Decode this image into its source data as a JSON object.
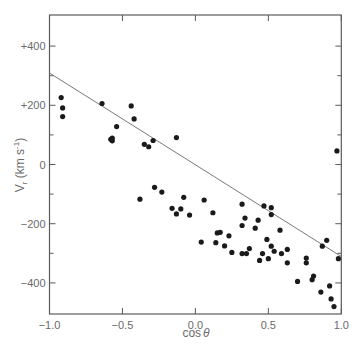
{
  "chart_data": {
    "type": "scatter",
    "title": "",
    "xlabel": "cos θ",
    "ylabel": "V_r (km s^-1)",
    "xlim": [
      -1.0,
      1.0
    ],
    "ylim": [
      -505,
      505
    ],
    "x_ticks": [
      -1.0,
      -0.5,
      0.0,
      0.5,
      1.0
    ],
    "x_tick_labels": [
      "−1.0",
      "−0.5",
      "0.0",
      "0.5",
      "1.0"
    ],
    "y_ticks": [
      400,
      200,
      0,
      -200,
      -400
    ],
    "y_tick_labels": [
      "+400",
      "+200",
      "0",
      "−200",
      "−400"
    ],
    "y_minor_ticks": [
      300,
      100,
      -100,
      -300
    ],
    "grid": false,
    "legend": null,
    "fit_line": {
      "x": [
        -1.0,
        1.0
      ],
      "y": [
        309,
        -311
      ]
    },
    "series": [
      {
        "name": "data",
        "points": [
          [
            -0.92,
            226
          ],
          [
            -0.91,
            191
          ],
          [
            -0.91,
            162
          ],
          [
            -0.64,
            206
          ],
          [
            -0.44,
            198
          ],
          [
            -0.42,
            154
          ],
          [
            -0.54,
            128
          ],
          [
            -0.58,
            85
          ],
          [
            -0.57,
            89
          ],
          [
            -0.57,
            80
          ],
          [
            -0.35,
            68
          ],
          [
            -0.32,
            60
          ],
          [
            -0.29,
            81
          ],
          [
            -0.13,
            91
          ],
          [
            -0.38,
            -117
          ],
          [
            -0.28,
            -77
          ],
          [
            -0.23,
            -93
          ],
          [
            -0.16,
            -148
          ],
          [
            -0.1,
            -150
          ],
          [
            -0.13,
            -167
          ],
          [
            -0.08,
            -111
          ],
          [
            -0.04,
            -171
          ],
          [
            0.06,
            -120
          ],
          [
            0.12,
            -163
          ],
          [
            0.15,
            -231
          ],
          [
            0.17,
            -229
          ],
          [
            0.04,
            -262
          ],
          [
            0.14,
            -264
          ],
          [
            0.2,
            -275
          ],
          [
            0.23,
            -241
          ],
          [
            0.25,
            -297
          ],
          [
            0.32,
            -134
          ],
          [
            0.34,
            -181
          ],
          [
            0.32,
            -206
          ],
          [
            0.41,
            -215
          ],
          [
            0.43,
            -188
          ],
          [
            0.47,
            -140
          ],
          [
            0.52,
            -146
          ],
          [
            0.52,
            -169
          ],
          [
            0.32,
            -301
          ],
          [
            0.35,
            -301
          ],
          [
            0.37,
            -284
          ],
          [
            0.44,
            -324
          ],
          [
            0.46,
            -301
          ],
          [
            0.49,
            -253
          ],
          [
            0.5,
            -318
          ],
          [
            0.52,
            -276
          ],
          [
            0.54,
            -293
          ],
          [
            0.58,
            -222
          ],
          [
            0.59,
            -301
          ],
          [
            0.63,
            -287
          ],
          [
            0.63,
            -332
          ],
          [
            0.76,
            -316
          ],
          [
            0.76,
            -332
          ],
          [
            0.7,
            -395
          ],
          [
            0.8,
            -389
          ],
          [
            0.81,
            -377
          ],
          [
            0.87,
            -276
          ],
          [
            0.9,
            -256
          ],
          [
            0.98,
            -318
          ],
          [
            0.92,
            -410
          ],
          [
            0.86,
            -431
          ],
          [
            0.93,
            -454
          ],
          [
            0.95,
            -480
          ],
          [
            0.97,
            46
          ]
        ]
      }
    ]
  },
  "labels": {
    "xlabel_prefix": "cos",
    "xlabel_symbol": "θ",
    "ylabel_main": "V",
    "ylabel_sub": "r",
    "ylabel_unit_open": " (km s",
    "ylabel_unit_exp": "-1",
    "ylabel_unit_close": ")"
  }
}
